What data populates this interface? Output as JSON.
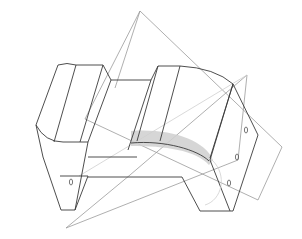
{
  "viewport": {
    "title": "",
    "background": "#ffffff",
    "colors": {
      "edge": "#3a3a3a",
      "plane": "#9a9a9a",
      "highlight": "#cfcfcf"
    }
  },
  "model": {
    "description": "Wireframe of a bent bracket part with a curved sweep arrow, intersected by two reference planes",
    "hole_labels": [
      "0",
      "0",
      "0",
      "0"
    ]
  }
}
